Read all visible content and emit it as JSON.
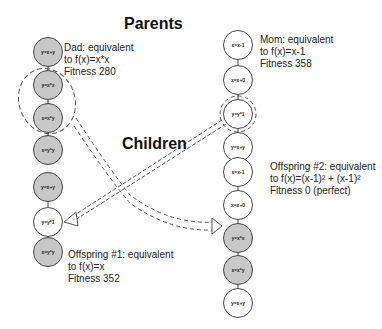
{
  "titles": {
    "parents": "Parents",
    "children": "Children"
  },
  "dad": {
    "caption": [
      "Dad: equivalent",
      "to f(x)=x*x",
      "Fitness 280"
    ],
    "nodes": [
      {
        "label": "y=x+y",
        "fill": "gray"
      },
      {
        "label": "y=x*x",
        "fill": "gray"
      },
      {
        "label": "x=x*y",
        "fill": "gray"
      },
      {
        "label": "x=y*y",
        "fill": "gray"
      }
    ]
  },
  "mom": {
    "caption": [
      "Mom: equivalent",
      "to f(x)=x-1",
      "Fitness 358"
    ],
    "nodes": [
      {
        "label": "x=x-1",
        "fill": "white"
      },
      {
        "label": "x=x+0",
        "fill": "white"
      },
      {
        "label": "y=y*1",
        "fill": "white"
      },
      {
        "label": "y=x+y",
        "fill": "white"
      }
    ]
  },
  "offspring1": {
    "caption": [
      "Offspring #1: equivalent",
      "to f(x)=x",
      "Fitness 352"
    ],
    "nodes": [
      {
        "label": "y=x+y",
        "fill": "gray"
      },
      {
        "label": "y=y*1",
        "fill": "white"
      },
      {
        "label": "x=y*y",
        "fill": "gray"
      }
    ]
  },
  "offspring2": {
    "caption": [
      "Offspring #2: equivalent",
      "to f(x)=(x-1)² + (x-1)²",
      "Fitness 0 (perfect)"
    ],
    "nodes": [
      {
        "label": "x=x-1",
        "fill": "white"
      },
      {
        "label": "x=x+0",
        "fill": "white"
      },
      {
        "label": "y=x*x",
        "fill": "gray"
      },
      {
        "label": "x=x*y",
        "fill": "gray"
      },
      {
        "label": "y=x+y",
        "fill": "white"
      }
    ]
  },
  "colors": {
    "gray_node": "#c8c8c8",
    "white_node": "#ffffff",
    "line": "#444444"
  }
}
